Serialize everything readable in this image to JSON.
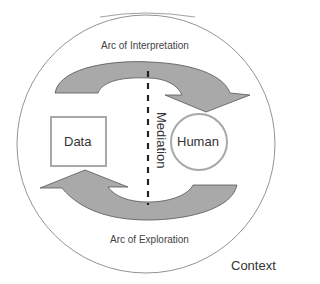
{
  "diagram": {
    "context_label": "Context",
    "arc_top_label": "Arc of Interpretation",
    "arc_bottom_label": "Arc of Exploration",
    "data_label": "Data",
    "human_label": "Human",
    "mediation_label": "Mediation"
  },
  "colors": {
    "arrow_fill": "#a9a9a9",
    "outline": "#555555",
    "node_border": "#a8a8a8",
    "dashed_line": "#222222"
  }
}
